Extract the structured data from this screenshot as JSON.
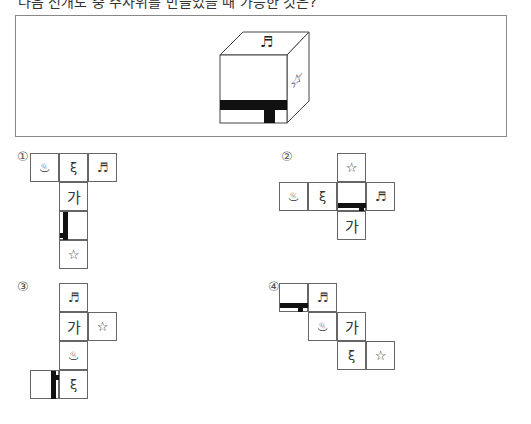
{
  "question": {
    "text": "다음 전개도 중 주사위를 만들었을 때 가능한 것은?"
  },
  "cube": {
    "top_symbol": "♬",
    "right_symbol": "☆",
    "front_pattern": "T-shaped black bar"
  },
  "options": [
    {
      "number": "①",
      "cells": [
        "♨",
        "ξ",
        "♬",
        "가",
        "",
        "☆"
      ]
    },
    {
      "number": "②",
      "cells": [
        "☆",
        "♨",
        "ξ",
        "",
        "♬",
        "가"
      ]
    },
    {
      "number": "③",
      "cells": [
        "♬",
        "가",
        "☆",
        "♨",
        "",
        "ξ"
      ]
    },
    {
      "number": "④",
      "cells": [
        "",
        "♬",
        "♨",
        "가",
        "ξ",
        "☆"
      ]
    }
  ],
  "colors": {
    "bar": "#111111",
    "border": "#666666"
  }
}
